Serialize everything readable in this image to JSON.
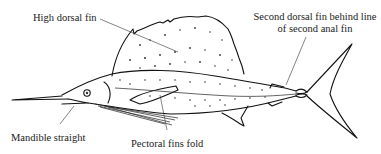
{
  "diagram": {
    "labels": {
      "high_dorsal_fin": "High dorsal fin",
      "second_dorsal_line1": "Second dorsal fin behind line",
      "second_dorsal_line2": "of second anal fin",
      "mandible": "Mandible straight",
      "pectoral": "Pectoral fins fold"
    },
    "colors": {
      "line": "#111111",
      "background": "#ffffff"
    }
  }
}
